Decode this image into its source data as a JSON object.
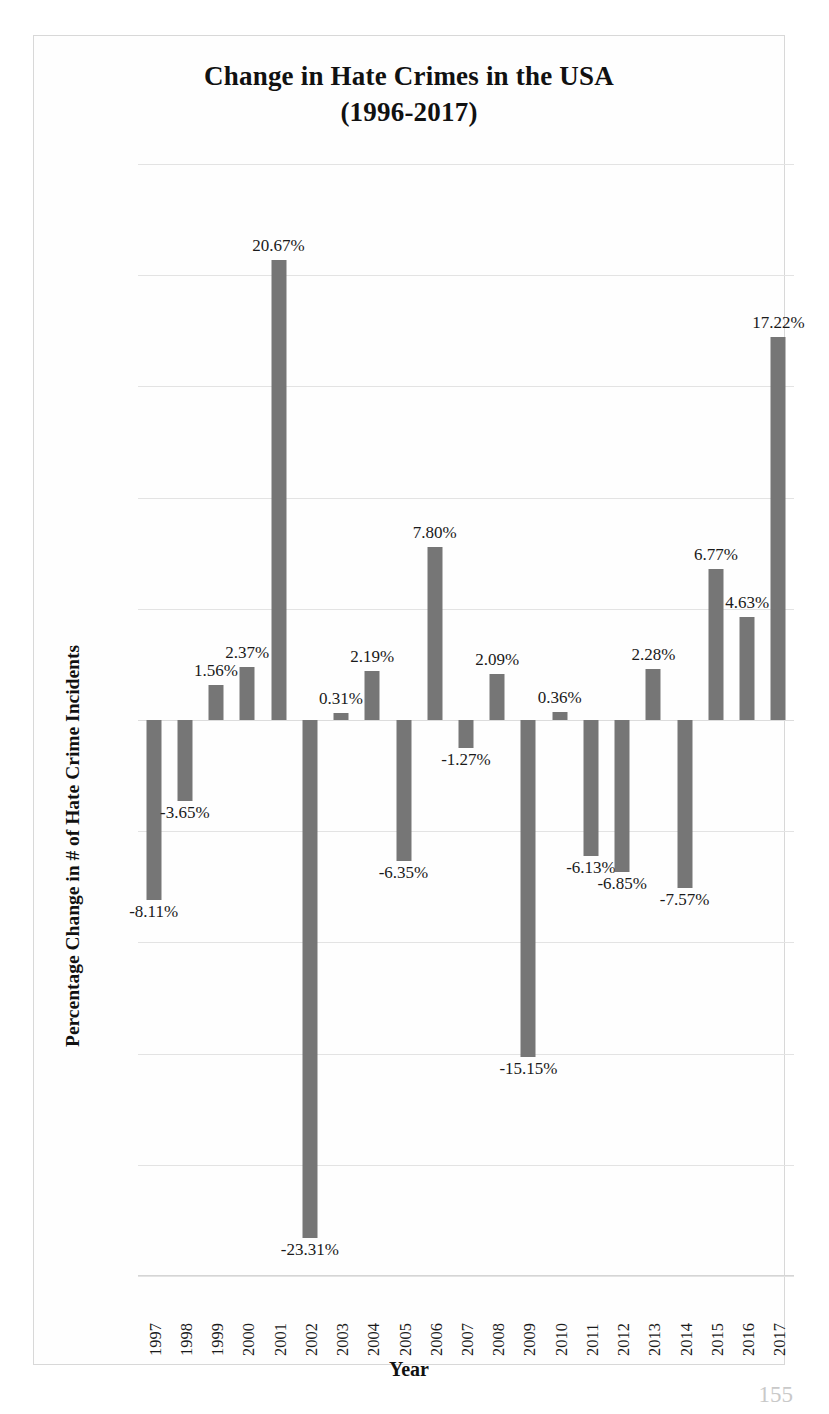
{
  "chart_data": {
    "type": "bar",
    "title": "Change in Hate Crimes in the USA (1996-2017)",
    "title_line1": "Change in Hate Crimes in the USA",
    "title_line2": "(1996-2017)",
    "xlabel": "Year",
    "ylabel": "Percentage Change in # of Hate Crime Incidents",
    "ylim": [
      -25,
      25
    ],
    "grid": true,
    "gridline_interval": 5,
    "legend": null,
    "bar_color": "#767676",
    "gridline_color": "#e3e3e3",
    "categories": [
      "1997",
      "1998",
      "1999",
      "2000",
      "2001",
      "2002",
      "2003",
      "2004",
      "2005",
      "2006",
      "2007",
      "2008",
      "2009",
      "2010",
      "2011",
      "2012",
      "2013",
      "2014",
      "2015",
      "2016",
      "2017"
    ],
    "values": [
      -8.11,
      -3.65,
      1.56,
      2.37,
      20.67,
      -23.31,
      0.31,
      2.19,
      -6.35,
      7.8,
      -1.27,
      2.09,
      -15.15,
      0.36,
      -6.13,
      -6.85,
      2.28,
      -7.57,
      6.77,
      4.63,
      17.22
    ],
    "data_labels": [
      "-8.11%",
      "-3.65%",
      "1.56%",
      "2.37%",
      "20.67%",
      "-23.31%",
      "0.31%",
      "2.19%",
      "-6.35%",
      "7.80%",
      "-1.27%",
      "2.09%",
      "-15.15%",
      "0.36%",
      "-6.13%",
      "-6.85%",
      "2.28%",
      "-7.57%",
      "6.77%",
      "4.63%",
      "17.22%"
    ]
  },
  "page": {
    "number": "155"
  }
}
